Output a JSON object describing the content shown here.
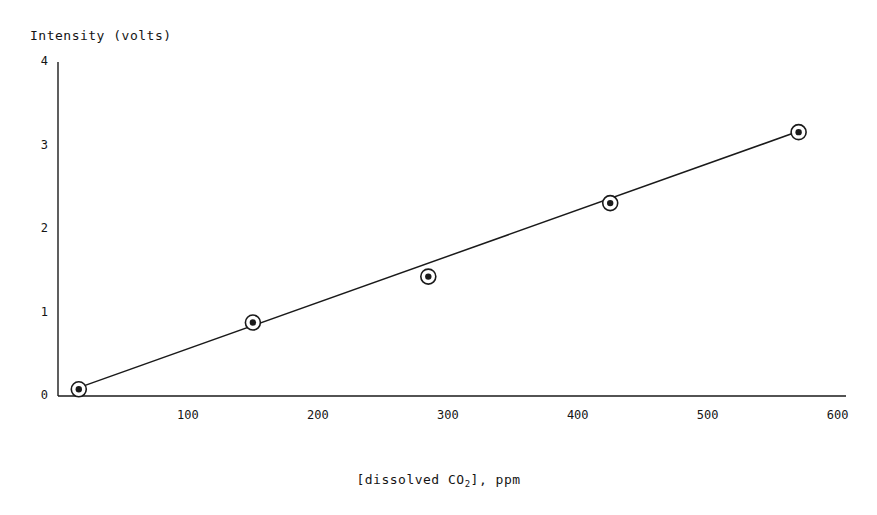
{
  "chart_data": {
    "type": "scatter",
    "title": "",
    "xlabel": "[dissolved CO2], ppm",
    "xlabel_parts": {
      "pre": "[dissolved CO",
      "sub": "2",
      "post": "], ppm"
    },
    "ylabel": "Intensity (volts)",
    "xlim": [
      0,
      620
    ],
    "ylim": [
      0,
      4
    ],
    "xticks": [
      "100",
      "200",
      "300",
      "400",
      "500",
      "600"
    ],
    "xtick_values": [
      100,
      200,
      300,
      400,
      500,
      600
    ],
    "yticks": [
      "0",
      "1",
      "2",
      "3",
      "4"
    ],
    "ytick_values": [
      0,
      1,
      2,
      3,
      4
    ],
    "grid": false,
    "legend": "none",
    "marker": "circle-with-center-dot",
    "series": [
      {
        "name": "Intensity vs dissolved CO2",
        "x": [
          16,
          150,
          285,
          425,
          570
        ],
        "y": [
          0.08,
          0.88,
          1.43,
          2.31,
          3.16
        ]
      }
    ],
    "fit_line": {
      "type": "linear",
      "x_start": 16,
      "y_start": 0.1,
      "x_end": 570,
      "y_end": 3.17
    },
    "colors": {
      "axis": "#1a1a1a",
      "marker_edge": "#1a1a1a",
      "marker_core": "#1a1a1a",
      "line": "#1a1a1a",
      "background": "#ffffff"
    }
  }
}
